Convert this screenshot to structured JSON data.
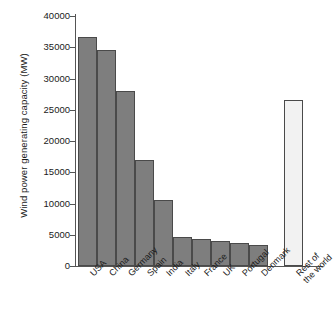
{
  "chart_data": {
    "type": "bar",
    "title": "",
    "xlabel": "",
    "ylabel": "Wind power generating capacity (MW)",
    "ylim": [
      0,
      40000
    ],
    "ytick_values": [
      0,
      5000,
      10000,
      15000,
      20000,
      25000,
      30000,
      35000,
      40000
    ],
    "ytick_labels": [
      "0",
      "5000",
      "10000",
      "15000",
      "20000",
      "25000",
      "30000",
      "35000",
      "40000"
    ],
    "grid": false,
    "legend": "none",
    "categories": [
      "USA",
      "China",
      "Germany",
      "Spain",
      "India",
      "Italy",
      "France",
      "UK",
      "Portugal",
      "Denmark",
      "Rest of\nthe world"
    ],
    "values": [
      36700,
      34500,
      28000,
      17000,
      10500,
      4700,
      4300,
      4000,
      3700,
      3400,
      26500
    ],
    "bar_colors": [
      "#7e7e7e",
      "#7e7e7e",
      "#7e7e7e",
      "#7e7e7e",
      "#7e7e7e",
      "#7e7e7e",
      "#7e7e7e",
      "#7e7e7e",
      "#7e7e7e",
      "#7e7e7e",
      "#f2f2f2"
    ],
    "bar_border_color": "#4a4a4a",
    "axis_color": "#555555",
    "text_color": "#1a1a1a",
    "background": "#ffffff"
  }
}
